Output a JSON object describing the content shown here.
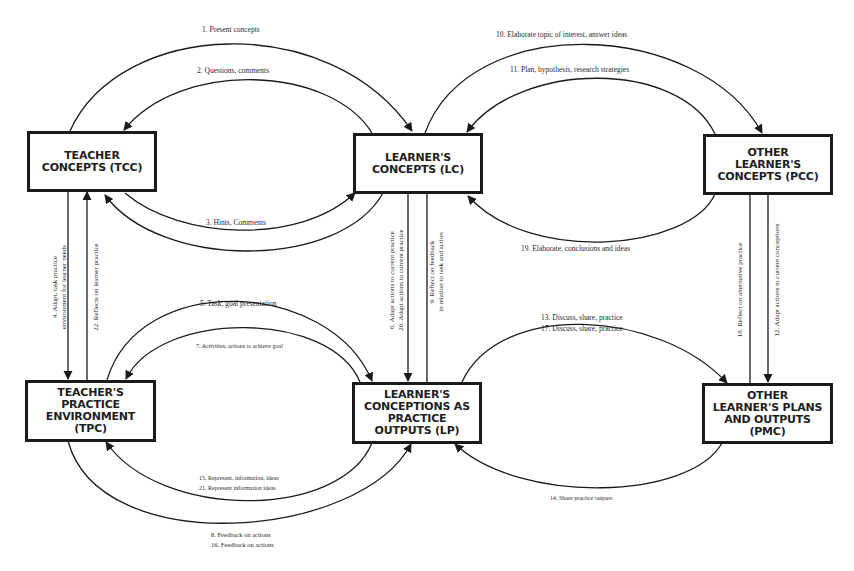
{
  "diagram": {
    "nodes": {
      "tcc": {
        "label": "TEACHER\nCONCEPTS (TCC)"
      },
      "lc": {
        "label": "LEARNER'S\nCONCEPTS (LC)"
      },
      "pcc": {
        "label": "OTHER\nLEARNER'S\nCONCEPTS (PCC)"
      },
      "tpc": {
        "label": "TEACHER'S\nPRACTICE\nENVIRONMENT (TPC)"
      },
      "lp": {
        "label": "LEARNER'S\nCONCEPTIONS AS\nPRACTICE\nOUTPUTS (LP)"
      },
      "pmc": {
        "label": "OTHER\nLEARNER'S PLANS\nAND OUTPUTS (PMC)"
      }
    },
    "edges": {
      "e1": {
        "label": "1. Present concepts",
        "from": "TCC",
        "to": "LC"
      },
      "e2": {
        "label": "2. Questions, comments",
        "from": "LC",
        "to": "TCC"
      },
      "e3": {
        "label": "3. Hints, Comments",
        "between": "TCC-LC"
      },
      "e4": {
        "label_line1": "4. Adapt, task practice",
        "label_line2": "environment for learner needs",
        "from": "TCC",
        "to": "TPC"
      },
      "e22": {
        "label": "22. Reflects on learner practice",
        "from": "TPC",
        "to": "TCC"
      },
      "e5": {
        "label": "5. Task, goal presentation",
        "from": "TPC",
        "to": "LP"
      },
      "e7": {
        "label": "7. Activities, actions to achieve goal",
        "from": "LP",
        "to": "TPC"
      },
      "e6": {
        "label_line1": "6. Adapt actions to current practice",
        "label_line2": "20. Adapt actions to current practice",
        "from": "LC",
        "to": "LP"
      },
      "e9": {
        "label_line1": "9. Reflect on feedback",
        "label_line2": "in relation to task and action",
        "from": "LP",
        "to": "LC"
      },
      "e10": {
        "label": "10. Elaborate topic of interest, answer ideas",
        "from": "LC",
        "to": "PCC"
      },
      "e11": {
        "label": "11. Plan, hypothesis, research strategies",
        "from": "PCC",
        "to": "LC"
      },
      "e19": {
        "label": "19. Elaborate, conclusions and ideas",
        "from": "PCC",
        "to": "LC"
      },
      "e18": {
        "label": "18. Reflect on alternative practice",
        "from": "PMC",
        "to": "PCC"
      },
      "e12": {
        "label": "12. Adapt actions to current conceptions",
        "from": "PCC",
        "to": "PMC"
      },
      "e13": {
        "label_line1": "13. Discuss, share, practice",
        "label_line2": "17. Discuss, share, practice",
        "from": "LP",
        "to": "PMC"
      },
      "e14": {
        "label": "14. Share practice outputs",
        "from": "PMC",
        "to": "LP"
      },
      "e15": {
        "label_line1": "15. Represent, information, ideas",
        "label_line2": "21. Represent information ideas",
        "from": "LP",
        "to": "TPC"
      },
      "e8": {
        "label_line1": "8. Feedback on actions",
        "label_line2": "16. Feedback on actions",
        "from": "TPC",
        "to": "LP"
      }
    },
    "colors": {
      "stroke": "#1a1a1a",
      "background": "#ffffff",
      "text": "#2a2a2a"
    }
  }
}
